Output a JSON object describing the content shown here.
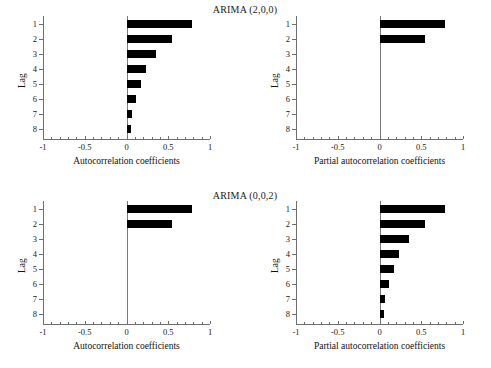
{
  "figure": {
    "width": 491,
    "height": 368,
    "background": "#ffffff",
    "bar_color": "#000000",
    "axis_color": "#6e6e6e"
  },
  "panels": [
    {
      "id": "arima-200-acf",
      "title": "ARIMA (2,0,0)",
      "xlabel": "Autocorrelation coefficients",
      "ylabel": "Lag"
    },
    {
      "id": "arima-200-pacf",
      "title": "",
      "xlabel": "Partial autocorrelation coefficients",
      "ylabel": "Lag"
    },
    {
      "id": "arima-002-acf",
      "title": "ARIMA (0,0,2)",
      "xlabel": "Autocorrelation coefficients",
      "ylabel": "Lag"
    },
    {
      "id": "arima-002-pacf",
      "title": "",
      "xlabel": "Partial autocorrelation coefficients",
      "ylabel": "Lag"
    }
  ],
  "titles": {
    "top": "ARIMA (2,0,0)",
    "bottom": "ARIMA (0,0,2)"
  },
  "axis": {
    "x_ticks": [
      "-1",
      "-0.5",
      "0",
      "0.5",
      "1"
    ],
    "x_tick_values": [
      -1,
      -0.5,
      0,
      0.5,
      1
    ],
    "y_ticks": [
      "1",
      "2",
      "3",
      "4",
      "5",
      "6",
      "7",
      "8"
    ],
    "y_tick_values": [
      1,
      2,
      3,
      4,
      5,
      6,
      7,
      8
    ],
    "xlabel_acf": "Autocorrelation coefficients",
    "xlabel_pacf": "Partial autocorrelation coefficients",
    "ylabel": "Lag"
  },
  "chart_data": [
    {
      "type": "bar",
      "orientation": "horizontal",
      "title": "ARIMA (2,0,0)",
      "subtitle": "Autocorrelation function",
      "xlabel": "Autocorrelation coefficients",
      "ylabel": "Lag",
      "xlim": [
        -1,
        1
      ],
      "grid": false,
      "legend": "none",
      "categories": [
        "1",
        "2",
        "3",
        "4",
        "5",
        "6",
        "7",
        "8"
      ],
      "values": [
        0.78,
        0.54,
        0.35,
        0.23,
        0.17,
        0.11,
        0.07,
        0.05
      ]
    },
    {
      "type": "bar",
      "orientation": "horizontal",
      "title": "ARIMA (2,0,0)",
      "subtitle": "Partial autocorrelation function",
      "xlabel": "Partial autocorrelation coefficients",
      "ylabel": "Lag",
      "xlim": [
        -1,
        1
      ],
      "grid": false,
      "legend": "none",
      "categories": [
        "1",
        "2",
        "3",
        "4",
        "5",
        "6",
        "7",
        "8"
      ],
      "values": [
        0.78,
        0.54,
        0,
        0,
        0,
        0,
        0,
        0
      ]
    },
    {
      "type": "bar",
      "orientation": "horizontal",
      "title": "ARIMA (0,0,2)",
      "subtitle": "Autocorrelation function",
      "xlabel": "Autocorrelation coefficients",
      "ylabel": "Lag",
      "xlim": [
        -1,
        1
      ],
      "grid": false,
      "legend": "none",
      "categories": [
        "1",
        "2",
        "3",
        "4",
        "5",
        "6",
        "7",
        "8"
      ],
      "values": [
        0.78,
        0.54,
        0,
        0,
        0,
        0,
        0,
        0
      ]
    },
    {
      "type": "bar",
      "orientation": "horizontal",
      "title": "ARIMA (0,0,2)",
      "subtitle": "Partial autocorrelation function",
      "xlabel": "Partial autocorrelation coefficients",
      "ylabel": "Lag",
      "xlim": [
        -1,
        1
      ],
      "grid": false,
      "legend": "none",
      "categories": [
        "1",
        "2",
        "3",
        "4",
        "5",
        "6",
        "7",
        "8"
      ],
      "values": [
        0.78,
        0.54,
        0.35,
        0.23,
        0.17,
        0.11,
        0.07,
        0.05
      ]
    }
  ]
}
